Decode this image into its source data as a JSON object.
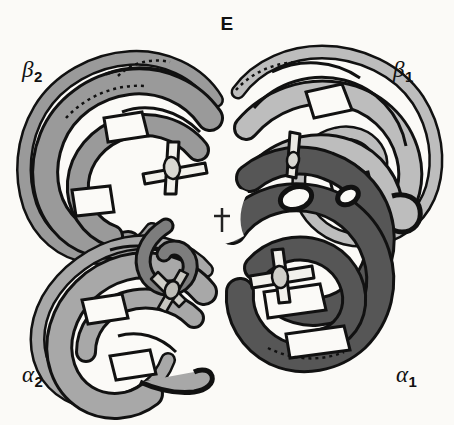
{
  "figure": {
    "panel_letter": "E",
    "background_color": "#fbfaf7",
    "outline_color": "#111111"
  },
  "labels": {
    "beta2": {
      "greek": "β",
      "subscript": "2"
    },
    "beta1": {
      "greek": "β",
      "subscript": "1"
    },
    "alpha2": {
      "greek": "α",
      "subscript": "2"
    },
    "alpha1": {
      "greek": "α",
      "subscript": "1"
    }
  },
  "subunits": [
    {
      "id": "beta2",
      "label": "β2",
      "fill": "#9a9a9a",
      "position": "upper-left"
    },
    {
      "id": "beta1",
      "label": "β1",
      "fill": "#bdbdbd",
      "position": "upper-right"
    },
    {
      "id": "alpha2",
      "label": "α2",
      "fill": "#a8a8a8",
      "position": "lower-left"
    },
    {
      "id": "alpha1",
      "label": "α1",
      "fill": "#565656",
      "position": "lower-right"
    }
  ],
  "hemes": [
    {
      "id": "heme-beta2",
      "fill": "#f2f1ec",
      "x": 171,
      "y": 165
    },
    {
      "id": "heme-beta1",
      "fill": "#e9e8e2",
      "x": 296,
      "y": 158
    },
    {
      "id": "heme-alpha1",
      "fill": "#f2f1ec",
      "x": 281,
      "y": 279
    },
    {
      "id": "heme-alpha2",
      "fill": "#d8d7d1",
      "x": 172,
      "y": 289
    }
  ],
  "symmetry_axis": {
    "symbol": "†",
    "caption": "two-fold axis",
    "x": 222,
    "y": 219
  },
  "colors": {
    "dark_gray": "#565656",
    "mid_gray": "#9a9a9a",
    "light_gray": "#bdbdbd",
    "alpha2_gray": "#a8a8a8",
    "heme_white": "#f2f1ec",
    "outline": "#111111",
    "background": "#fbfaf7"
  }
}
